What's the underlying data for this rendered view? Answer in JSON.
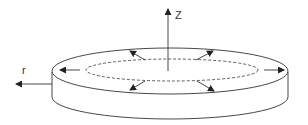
{
  "diagram": {
    "type": "disc-radial-expansion",
    "axes": {
      "z_label": "Z",
      "r_label": "r"
    },
    "colors": {
      "stroke": "#333333",
      "background": "#ffffff"
    },
    "radial_arrows_count": 8
  }
}
